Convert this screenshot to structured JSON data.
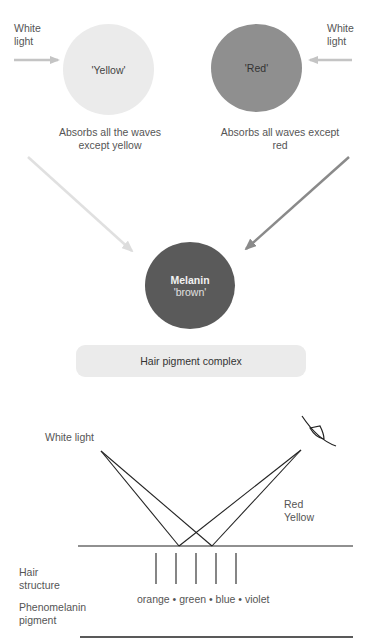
{
  "top": {
    "left_input_label": [
      "White",
      "light"
    ],
    "right_input_label": [
      "White",
      "light"
    ],
    "yellow_circle": {
      "label": "'Yellow'",
      "color": "#ebebeb"
    },
    "red_circle": {
      "label": "'Red'",
      "color": "#8f8f8f"
    },
    "yellow_caption": [
      "Absorbs all the waves",
      "except yellow"
    ],
    "red_caption": [
      "Absorbs all waves except",
      "red"
    ],
    "melanin_circle": {
      "title": "Melanin",
      "subtitle": "'brown'",
      "color": "#5a5a5a"
    },
    "pill_label": "Hair pigment complex"
  },
  "bottom": {
    "white_light_label": "White light",
    "reflected_labels": [
      "Red",
      "Yellow"
    ],
    "hair_structure_label": [
      "Hair",
      "structure"
    ],
    "pigment_label": [
      "Phenomelanin",
      "pigment"
    ],
    "absorbed_colors": "orange • green • blue • violet"
  },
  "colors": {
    "light_arrow": "#c8c8c8",
    "yellow_arrow": "#e0e0e0",
    "red_arrow": "#8a8a8a",
    "line": "#222222"
  }
}
